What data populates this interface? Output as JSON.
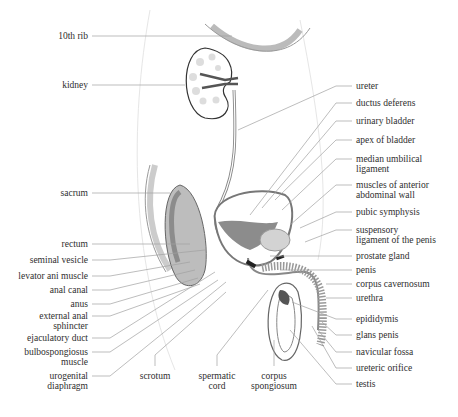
{
  "diagram": {
    "left_labels": [
      {
        "id": "10th-rib",
        "lines": [
          "10th rib"
        ],
        "y": 36
      },
      {
        "id": "kidney",
        "lines": [
          "kidney"
        ],
        "y": 85
      },
      {
        "id": "sacrum",
        "lines": [
          "sacrum"
        ],
        "y": 193
      },
      {
        "id": "rectum",
        "lines": [
          "rectum"
        ],
        "y": 244
      },
      {
        "id": "seminal-vesicle",
        "lines": [
          "seminal vesicle"
        ],
        "y": 260
      },
      {
        "id": "levator-ani-muscle",
        "lines": [
          "levator ani muscle"
        ],
        "y": 276
      },
      {
        "id": "anal-canal",
        "lines": [
          "anal canal"
        ],
        "y": 290
      },
      {
        "id": "anus",
        "lines": [
          "anus"
        ],
        "y": 304
      },
      {
        "id": "external-anal-sphincter",
        "lines": [
          "external anal",
          "sphincter"
        ],
        "y": 316
      },
      {
        "id": "ejaculatory-duct",
        "lines": [
          "ejaculatory duct"
        ],
        "y": 338
      },
      {
        "id": "bulbospongiosus-muscle",
        "lines": [
          "bulbospongiosus",
          "muscle"
        ],
        "y": 352
      },
      {
        "id": "urogenital-diaphragm",
        "lines": [
          "urogenital",
          "diaphragm"
        ],
        "y": 376
      }
    ],
    "bottom_labels": [
      {
        "id": "scrotum",
        "lines": [
          "scrotum"
        ],
        "x": 155
      },
      {
        "id": "spermatic-cord",
        "lines": [
          "spermatic",
          "cord"
        ],
        "x": 217
      },
      {
        "id": "corpus-spongiosum",
        "lines": [
          "corpus",
          "spongiosum"
        ],
        "x": 274
      }
    ],
    "right_labels": [
      {
        "id": "ureter",
        "lines": [
          "ureter"
        ],
        "y": 86
      },
      {
        "id": "ductus-deferens",
        "lines": [
          "ductus deferens"
        ],
        "y": 103
      },
      {
        "id": "urinary-bladder",
        "lines": [
          "urinary bladder"
        ],
        "y": 121
      },
      {
        "id": "apex-of-bladder",
        "lines": [
          "apex of bladder"
        ],
        "y": 140
      },
      {
        "id": "median-umbilical-ligament",
        "lines": [
          "median umbilical",
          "ligament"
        ],
        "y": 159
      },
      {
        "id": "muscles-of-anterior-abdominal-wall",
        "lines": [
          "muscles of anterior",
          "abdominal wall"
        ],
        "y": 185
      },
      {
        "id": "pubic-symphysis",
        "lines": [
          "pubic symphysis"
        ],
        "y": 212
      },
      {
        "id": "suspensory-ligament-of-the-penis",
        "lines": [
          "suspensory",
          "ligament of the penis"
        ],
        "y": 230
      },
      {
        "id": "prostate-gland",
        "lines": [
          "prostate gland"
        ],
        "y": 256
      },
      {
        "id": "penis",
        "lines": [
          "penis"
        ],
        "y": 270
      },
      {
        "id": "corpus-cavernosum",
        "lines": [
          "corpus cavernosum"
        ],
        "y": 284
      },
      {
        "id": "urethra",
        "lines": [
          "urethra"
        ],
        "y": 298
      },
      {
        "id": "epididymis",
        "lines": [
          "epididymis"
        ],
        "y": 319
      },
      {
        "id": "glans-penis",
        "lines": [
          "glans penis"
        ],
        "y": 335
      },
      {
        "id": "navicular-fossa",
        "lines": [
          "navicular fossa"
        ],
        "y": 352
      },
      {
        "id": "ureteric-orifice",
        "lines": [
          "ureteric orifice"
        ],
        "y": 368
      },
      {
        "id": "testis",
        "lines": [
          "testis"
        ],
        "y": 384
      }
    ],
    "colors": {
      "line": "#9a9a9a",
      "outline": "#555555",
      "tissue": "#bdbdbd",
      "tissue_dark": "#8c8c8c",
      "bg": "#ffffff"
    }
  }
}
